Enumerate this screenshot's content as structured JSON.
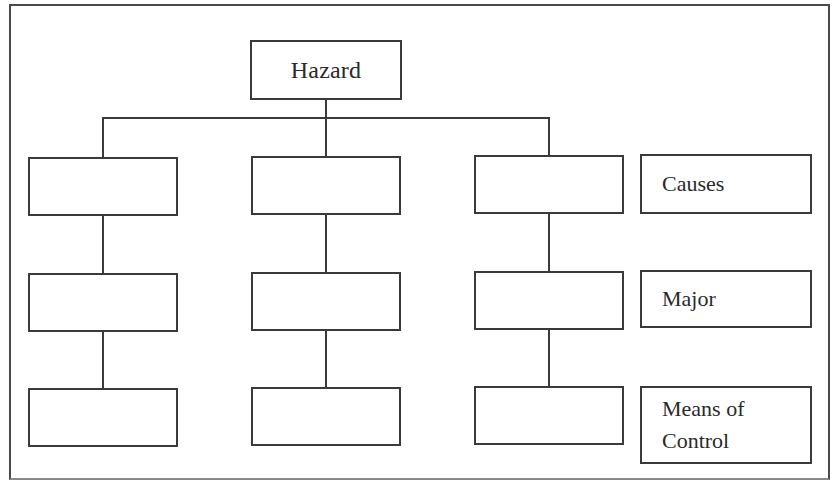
{
  "diagram": {
    "type": "hierarchy-tree",
    "root": {
      "label": "Hazard"
    },
    "columns": [
      {
        "id": "branch-1",
        "nodes": [
          {
            "row": "causes",
            "label": ""
          },
          {
            "row": "major",
            "label": ""
          },
          {
            "row": "means-of-control",
            "label": ""
          }
        ]
      },
      {
        "id": "branch-2",
        "nodes": [
          {
            "row": "causes",
            "label": ""
          },
          {
            "row": "major",
            "label": ""
          },
          {
            "row": "means-of-control",
            "label": ""
          }
        ]
      },
      {
        "id": "branch-3",
        "nodes": [
          {
            "row": "causes",
            "label": ""
          },
          {
            "row": "major",
            "label": ""
          },
          {
            "row": "means-of-control",
            "label": ""
          }
        ]
      }
    ],
    "row_labels": [
      {
        "id": "causes",
        "label": "Causes"
      },
      {
        "id": "major",
        "label": "Major"
      },
      {
        "id": "means-of-control",
        "label_line1": "Means of",
        "label_line2": "Control"
      }
    ],
    "colors": {
      "line": "#3a3a3a",
      "background": "#ffffff",
      "text": "#2a2a2a"
    }
  }
}
